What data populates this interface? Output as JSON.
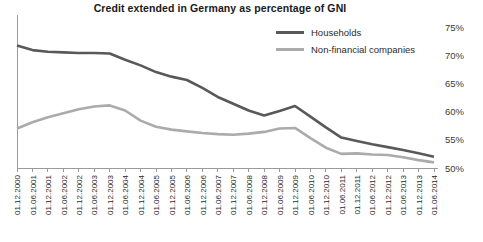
{
  "chart_data": {
    "type": "line",
    "title": "Credit extended in Germany as percentage of GNI",
    "xlabel": "",
    "ylabel": "",
    "ylim": [
      50,
      75
    ],
    "ytick_values": [
      50,
      55,
      60,
      65,
      70,
      75
    ],
    "ytick_labels": [
      "50%",
      "55%",
      "60%",
      "65%",
      "70%",
      "75%"
    ],
    "yaxis_position": "right",
    "grid": false,
    "legend_position": "top-right",
    "categories": [
      "01.12.2000",
      "01.06.2001",
      "01.12.2001",
      "01.06.2002",
      "01.12.2002",
      "01.06.2003",
      "01.12.2003",
      "01.06.2004",
      "01.12.2004",
      "01.06.2005",
      "01.12.2005",
      "01.06.2006",
      "01.12.2006",
      "01.06.2007",
      "01.12.2007",
      "01.06.2008",
      "01.12.2008",
      "01.06.2009",
      "01.12.2009",
      "01.06.2010",
      "01.12.2010",
      "01.06.2011",
      "01.12.2011",
      "01.06.2012",
      "01.12.2012",
      "01.06.2013",
      "01.12.2013",
      "01.06.2014"
    ],
    "series": [
      {
        "name": "Households",
        "color": "#595959",
        "width": 2.6,
        "values": [
          71.7,
          70.9,
          70.6,
          70.5,
          70.4,
          70.4,
          70.3,
          69.2,
          68.2,
          67.0,
          66.2,
          65.6,
          64.2,
          62.6,
          61.4,
          60.2,
          59.3,
          60.1,
          61.0,
          59.1,
          57.2,
          55.4,
          54.8,
          54.2,
          53.7,
          53.2,
          52.6,
          52.0
        ]
      },
      {
        "name": "Non-financial companies",
        "color": "#ababab",
        "width": 2.6,
        "values": [
          57.0,
          58.1,
          59.0,
          59.7,
          60.4,
          60.9,
          61.1,
          60.2,
          58.4,
          57.3,
          56.8,
          56.5,
          56.2,
          56.0,
          55.9,
          56.1,
          56.4,
          57.0,
          57.1,
          55.3,
          53.6,
          52.5,
          52.6,
          52.4,
          52.3,
          51.9,
          51.4,
          51.0
        ]
      }
    ]
  },
  "legend": {
    "items": [
      {
        "label": "Households",
        "color": "#595959"
      },
      {
        "label": "Non-financial companies",
        "color": "#ababab"
      }
    ]
  },
  "plot_geometry": {
    "left": 17,
    "right": 434,
    "top": 27,
    "bottom": 168
  }
}
